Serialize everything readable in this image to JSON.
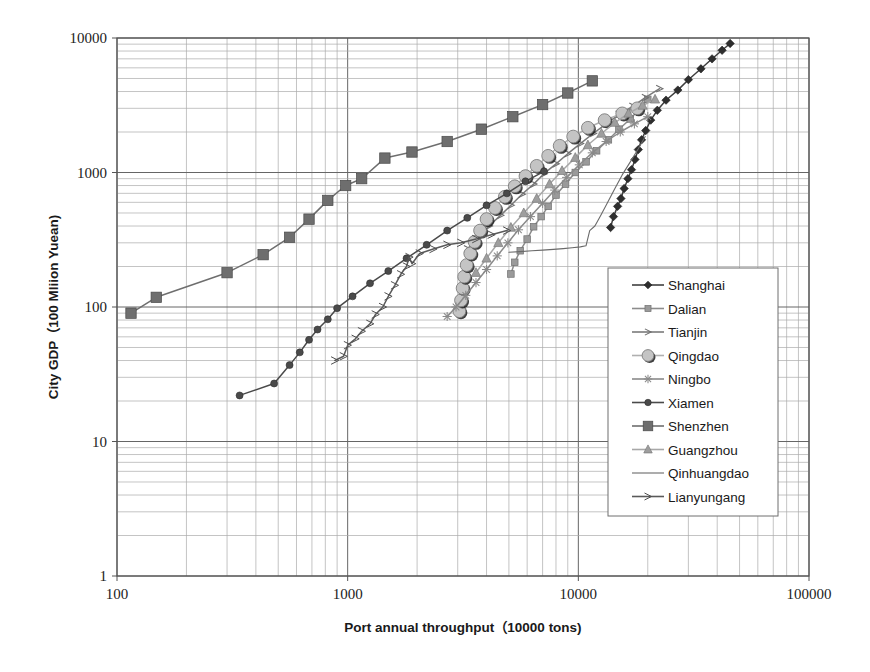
{
  "chart_data": {
    "type": "line",
    "title": "",
    "xlabel": "Port annual throughput（10000 tons)",
    "ylabel": "City GDP（100 Mliion Yuean)",
    "xscale": "log",
    "yscale": "log",
    "xlim": [
      100,
      100000
    ],
    "ylim": [
      1,
      10000
    ],
    "xticks": [
      "100",
      "1000",
      "10000",
      "100000"
    ],
    "yticks": [
      "1",
      "10",
      "100",
      "1000",
      "10000"
    ],
    "grid": "major and minor log gridlines on both axes",
    "legend_position": "center-right inside plot area",
    "series": [
      {
        "name": "Shanghai",
        "marker": "diamond",
        "color": "#3f3f3f",
        "points": [
          [
            13800,
            390
          ],
          [
            14200,
            470
          ],
          [
            14800,
            560
          ],
          [
            15300,
            640
          ],
          [
            15800,
            760
          ],
          [
            16400,
            900
          ],
          [
            17000,
            1050
          ],
          [
            17600,
            1250
          ],
          [
            18200,
            1480
          ],
          [
            18800,
            1750
          ],
          [
            19600,
            2050
          ],
          [
            20600,
            2450
          ],
          [
            22000,
            2900
          ],
          [
            24000,
            3450
          ],
          [
            27000,
            4100
          ],
          [
            30000,
            4900
          ],
          [
            34000,
            5900
          ],
          [
            38000,
            7000
          ],
          [
            42000,
            8100
          ],
          [
            45500,
            9100
          ]
        ]
      },
      {
        "name": "Dalian",
        "marker": "small-square",
        "color": "#8c8c8c",
        "points": [
          [
            5100,
            176
          ],
          [
            5300,
            215
          ],
          [
            5600,
            262
          ],
          [
            6000,
            320
          ],
          [
            6400,
            395
          ],
          [
            6900,
            470
          ],
          [
            7400,
            560
          ],
          [
            8000,
            680
          ],
          [
            8800,
            820
          ],
          [
            9700,
            1000
          ],
          [
            10800,
            1200
          ],
          [
            12000,
            1450
          ],
          [
            13500,
            1750
          ],
          [
            15000,
            2100
          ],
          [
            16800,
            2500
          ],
          [
            18500,
            3000
          ],
          [
            20000,
            3500
          ]
        ]
      },
      {
        "name": "Tianjin",
        "marker": "tick-arrow",
        "color": "#7a7a7a",
        "points": [
          [
            3300,
            270
          ],
          [
            3700,
            330
          ],
          [
            4100,
            400
          ],
          [
            4600,
            480
          ],
          [
            5100,
            570
          ],
          [
            5700,
            690
          ],
          [
            6400,
            820
          ],
          [
            7100,
            980
          ],
          [
            8000,
            1160
          ],
          [
            9000,
            1380
          ],
          [
            10200,
            1640
          ],
          [
            11600,
            1950
          ],
          [
            13200,
            2300
          ],
          [
            15000,
            2700
          ],
          [
            17200,
            3100
          ],
          [
            19500,
            3600
          ],
          [
            22500,
            4200
          ]
        ]
      },
      {
        "name": "Qingdao",
        "marker": "circle-light",
        "color": "#b0b0b0",
        "points": [
          [
            3050,
            93
          ],
          [
            3100,
            112
          ],
          [
            3150,
            138
          ],
          [
            3200,
            168
          ],
          [
            3280,
            205
          ],
          [
            3400,
            250
          ],
          [
            3550,
            305
          ],
          [
            3750,
            370
          ],
          [
            4000,
            450
          ],
          [
            4350,
            545
          ],
          [
            4800,
            660
          ],
          [
            5300,
            790
          ],
          [
            5900,
            940
          ],
          [
            6600,
            1120
          ],
          [
            7400,
            1330
          ],
          [
            8300,
            1580
          ],
          [
            9500,
            1850
          ],
          [
            11000,
            2150
          ],
          [
            13000,
            2450
          ],
          [
            15500,
            2750
          ],
          [
            18000,
            3000
          ]
        ]
      },
      {
        "name": "Ningbo",
        "marker": "asterisk",
        "color": "#8a8a8a",
        "points": [
          [
            2700,
            85
          ],
          [
            2950,
            100
          ],
          [
            3250,
            122
          ],
          [
            3600,
            152
          ],
          [
            4000,
            190
          ],
          [
            4450,
            240
          ],
          [
            4950,
            300
          ],
          [
            5500,
            375
          ],
          [
            6200,
            470
          ],
          [
            7000,
            590
          ],
          [
            7900,
            740
          ],
          [
            8900,
            920
          ],
          [
            10100,
            1140
          ],
          [
            11500,
            1400
          ],
          [
            13200,
            1700
          ],
          [
            15200,
            2000
          ],
          [
            17500,
            2300
          ],
          [
            20000,
            2600
          ]
        ]
      },
      {
        "name": "Xiamen",
        "marker": "small-circle",
        "color": "#4a4a4a",
        "points": [
          [
            340,
            22
          ],
          [
            480,
            27
          ],
          [
            560,
            37
          ],
          [
            620,
            46
          ],
          [
            680,
            57
          ],
          [
            740,
            68
          ],
          [
            820,
            81
          ],
          [
            900,
            98
          ],
          [
            1050,
            120
          ],
          [
            1250,
            150
          ],
          [
            1500,
            185
          ],
          [
            1800,
            230
          ],
          [
            2200,
            290
          ],
          [
            2700,
            370
          ],
          [
            3300,
            460
          ],
          [
            4000,
            570
          ],
          [
            4900,
            700
          ],
          [
            5900,
            860
          ],
          [
            7100,
            1020
          ]
        ]
      },
      {
        "name": "Shenzhen",
        "marker": "square",
        "color": "#6e6e6e",
        "points": [
          [
            115,
            90
          ],
          [
            148,
            118
          ],
          [
            300,
            180
          ],
          [
            430,
            245
          ],
          [
            560,
            330
          ],
          [
            680,
            450
          ],
          [
            820,
            620
          ],
          [
            980,
            800
          ],
          [
            1150,
            900
          ],
          [
            1450,
            1280
          ],
          [
            1900,
            1420
          ],
          [
            2700,
            1700
          ],
          [
            3800,
            2100
          ],
          [
            5200,
            2600
          ],
          [
            7000,
            3200
          ],
          [
            9000,
            3900
          ],
          [
            11500,
            4800
          ]
        ]
      },
      {
        "name": "Guangzhou",
        "marker": "triangle",
        "color": "#a8a8a8",
        "points": [
          [
            3600,
            180
          ],
          [
            4000,
            230
          ],
          [
            4500,
            300
          ],
          [
            5100,
            390
          ],
          [
            5800,
            500
          ],
          [
            6600,
            640
          ],
          [
            7500,
            820
          ],
          [
            8500,
            1030
          ],
          [
            9700,
            1290
          ],
          [
            11000,
            1600
          ],
          [
            12600,
            1950
          ],
          [
            14400,
            2350
          ],
          [
            16500,
            2750
          ],
          [
            19000,
            3150
          ],
          [
            21500,
            3500
          ]
        ]
      },
      {
        "name": "Qinhuangdao",
        "marker": "none",
        "color": "#6a6a6a",
        "points": [
          [
            5000,
            255
          ],
          [
            5600,
            258
          ],
          [
            6300,
            262
          ],
          [
            7000,
            265
          ],
          [
            7800,
            268
          ],
          [
            8600,
            272
          ],
          [
            9400,
            276
          ],
          [
            10200,
            280
          ],
          [
            10800,
            285
          ],
          [
            11200,
            370
          ],
          [
            11800,
            400
          ],
          [
            12500,
            480
          ],
          [
            13400,
            600
          ],
          [
            14400,
            760
          ],
          [
            15500,
            960
          ],
          [
            16800,
            1200
          ],
          [
            18200,
            1500
          ],
          [
            19500,
            1850
          ]
        ]
      },
      {
        "name": "Lianyungang",
        "marker": "open-arrow",
        "color": "#5a5a5a",
        "points": [
          [
            880,
            40
          ],
          [
            960,
            43
          ],
          [
            1000,
            52
          ],
          [
            1080,
            58
          ],
          [
            1150,
            66
          ],
          [
            1250,
            75
          ],
          [
            1320,
            88
          ],
          [
            1420,
            100
          ],
          [
            1500,
            120
          ],
          [
            1600,
            145
          ],
          [
            1700,
            175
          ],
          [
            1800,
            200
          ],
          [
            1850,
            235
          ],
          [
            1900,
            210
          ],
          [
            2050,
            250
          ],
          [
            2350,
            270
          ],
          [
            2700,
            290
          ],
          [
            3100,
            300
          ],
          [
            3600,
            320
          ],
          [
            4200,
            345
          ],
          [
            4900,
            370
          ]
        ]
      }
    ]
  },
  "legend": {
    "entries": [
      {
        "label": "Shanghai"
      },
      {
        "label": "Dalian"
      },
      {
        "label": "Tianjin"
      },
      {
        "label": "Qingdao"
      },
      {
        "label": "Ningbo"
      },
      {
        "label": "Xiamen"
      },
      {
        "label": "Shenzhen"
      },
      {
        "label": "Guangzhou"
      },
      {
        "label": "Qinhuangdao"
      },
      {
        "label": "Lianyungang"
      }
    ]
  },
  "colors": {
    "background": "#ffffff",
    "frame": "#555555",
    "major_grid": "#666666",
    "minor_grid": "#aaaaaa",
    "text": "#1a1a1a"
  }
}
